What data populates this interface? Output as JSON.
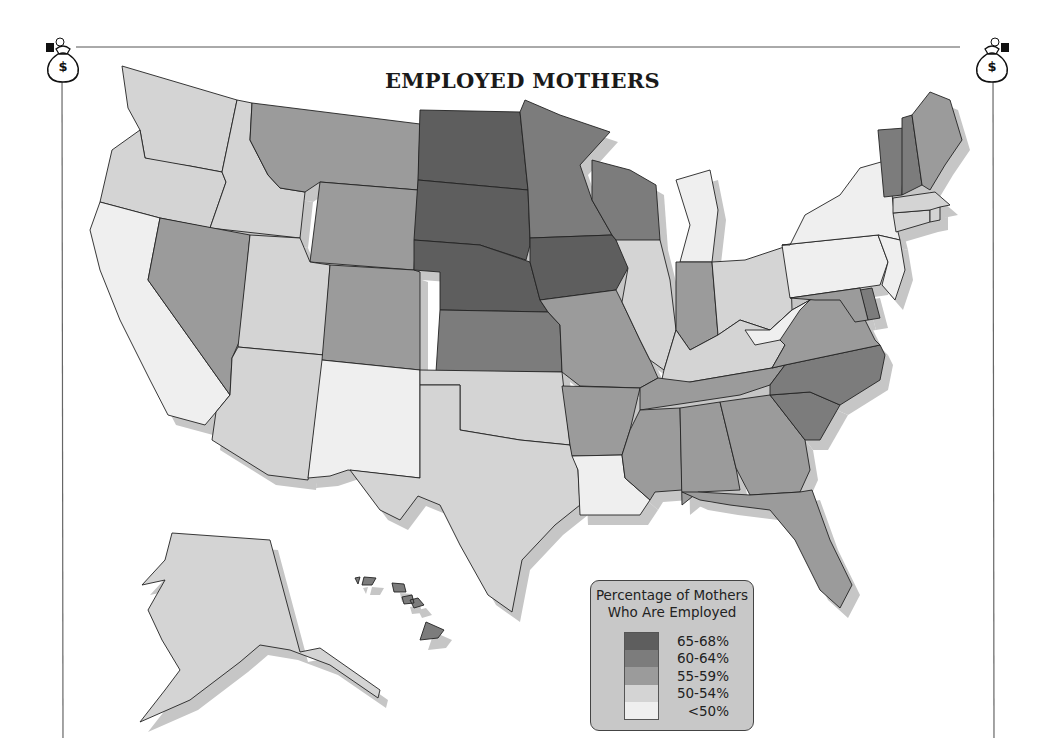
{
  "title": "EMPLOYED MOTHERS",
  "icons": {
    "left": "money-bag-icon",
    "right": "money-bag-icon"
  },
  "legend": {
    "title_line1": "Percentage of Mothers",
    "title_line2": "Who Are Employed",
    "categories": [
      {
        "key": "c1",
        "label": "65-68%",
        "color": "#5e5e5e"
      },
      {
        "key": "c2",
        "label": "60-64%",
        "color": "#7c7c7c"
      },
      {
        "key": "c3",
        "label": "55-59%",
        "color": "#9b9b9b"
      },
      {
        "key": "c4",
        "label": "50-54%",
        "color": "#d4d4d4"
      },
      {
        "key": "c5",
        "label": "<50%",
        "color": "#efefef"
      }
    ]
  },
  "chart_data": {
    "type": "choropleth",
    "title": "EMPLOYED MOTHERS",
    "legend_title": "Percentage of Mothers Who Are Employed",
    "legend_position": "bottom-center",
    "states": {
      "WA": "50-54%",
      "OR": "50-54%",
      "CA": "<50%",
      "ID": "50-54%",
      "NV": "55-59%",
      "MT": "55-59%",
      "WY": "55-59%",
      "UT": "50-54%",
      "AZ": "50-54%",
      "CO": "55-59%",
      "NM": "<50%",
      "ND": "65-68%",
      "SD": "65-68%",
      "NE": "65-68%",
      "KS": "60-64%",
      "OK": "50-54%",
      "TX": "50-54%",
      "MN": "60-64%",
      "IA": "65-68%",
      "MO": "55-59%",
      "AR": "55-59%",
      "LA": "<50%",
      "WI": "60-64%",
      "IL": "50-54%",
      "MI": "<50%",
      "IN": "55-59%",
      "OH": "50-54%",
      "KY": "50-54%",
      "TN": "55-59%",
      "MS": "55-59%",
      "AL": "55-59%",
      "GA": "55-59%",
      "FL": "55-59%",
      "SC": "60-64%",
      "NC": "60-64%",
      "VA": "55-59%",
      "WV": "<50%",
      "PA": "<50%",
      "NY": "<50%",
      "NJ": "<50%",
      "DE": "60-64%",
      "MD": "55-59%",
      "CT": "50-54%",
      "RI": "50-54%",
      "MA": "50-54%",
      "VT": "60-64%",
      "NH": "60-64%",
      "ME": "55-59%",
      "AK": "50-54%",
      "HI": "60-64%"
    }
  }
}
